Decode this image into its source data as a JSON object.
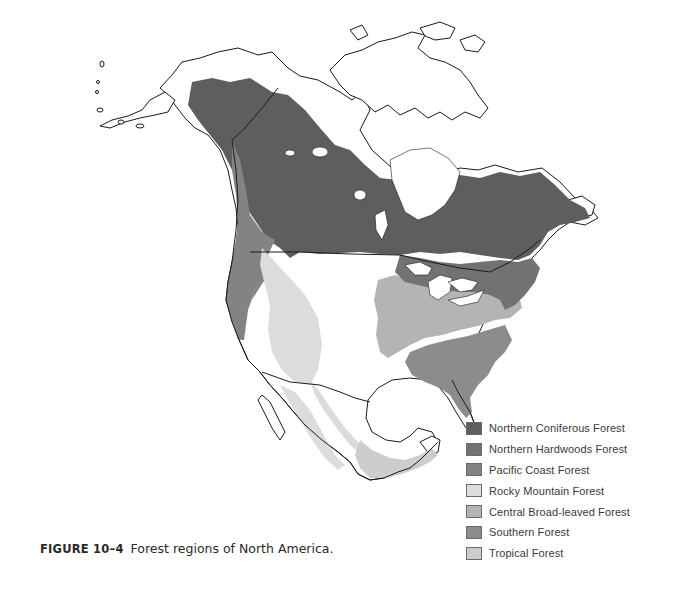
{
  "figure": {
    "label": "FIGURE 10–4",
    "caption": "Forest regions of North America."
  },
  "map": {
    "title": "Forest regions of North America",
    "land_color": "#ffffff",
    "outline_color": "#1a1a1a",
    "regions": [
      {
        "name": "Northern Coniferous Forest",
        "color": "#5e5e5e"
      },
      {
        "name": "Northern Hardwoods Forest",
        "color": "#727272"
      },
      {
        "name": "Pacific Coast Forest",
        "color": "#838383"
      },
      {
        "name": "Rocky Mountain Forest",
        "color": "#dcdcdc"
      },
      {
        "name": "Central Broad-leaved Forest",
        "color": "#b4b4b4"
      },
      {
        "name": "Southern Forest",
        "color": "#8c8c8c"
      },
      {
        "name": "Tropical Forest",
        "color": "#cdcdcd"
      }
    ]
  },
  "legend": {
    "items": [
      {
        "label": "Northern Coniferous Forest",
        "color": "#5e5e5e"
      },
      {
        "label": "Northern Hardwoods Forest",
        "color": "#727272"
      },
      {
        "label": "Pacific Coast Forest",
        "color": "#838383"
      },
      {
        "label": "Rocky Mountain Forest",
        "color": "#dcdcdc"
      },
      {
        "label": "Central Broad-leaved Forest",
        "color": "#b4b4b4"
      },
      {
        "label": "Southern Forest",
        "color": "#8c8c8c"
      },
      {
        "label": "Tropical Forest",
        "color": "#cdcdcd"
      }
    ]
  }
}
